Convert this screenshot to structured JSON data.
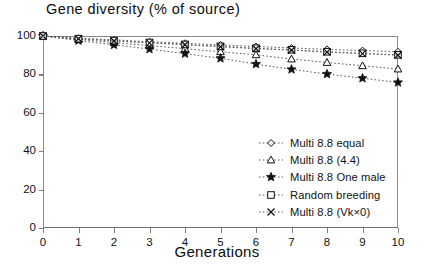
{
  "chart_data": {
    "type": "line",
    "title": "Gene diversity (% of source)",
    "xlabel": "Generations",
    "ylabel": "",
    "x": [
      0,
      1,
      2,
      3,
      4,
      5,
      6,
      7,
      8,
      9,
      10
    ],
    "xlim": [
      0,
      10
    ],
    "ylim": [
      0,
      100
    ],
    "xticks": [
      "0",
      "1",
      "2",
      "3",
      "4",
      "5",
      "6",
      "7",
      "8",
      "9",
      "10"
    ],
    "yticks": [
      "0",
      "20",
      "40",
      "60",
      "80",
      "100"
    ],
    "grid": false,
    "legend_position": "center-right",
    "series": [
      {
        "name": "Multi 8.8 equal",
        "marker": "diamond",
        "values": [
          100,
          98.8,
          98.0,
          97.0,
          96.2,
          95.4,
          94.5,
          93.8,
          93.0,
          92.4,
          91.8
        ]
      },
      {
        "name": "Multi 8.8 (4.4)",
        "marker": "triangle",
        "values": [
          100,
          98.2,
          96.6,
          95.0,
          93.4,
          91.8,
          90.2,
          88.0,
          86.2,
          84.5,
          82.8
        ]
      },
      {
        "name": "Multi 8.8 One male",
        "marker": "star",
        "values": [
          100,
          97.6,
          95.4,
          93.2,
          90.8,
          88.4,
          85.4,
          82.6,
          80.2,
          78.0,
          75.8
        ]
      },
      {
        "name": "Random breeding",
        "marker": "square",
        "values": [
          100,
          98.6,
          97.6,
          96.6,
          95.6,
          94.6,
          93.6,
          92.8,
          91.8,
          91.0,
          90.2
        ]
      },
      {
        "name": "Multi 8.8 (Vk×0)",
        "marker": "cross",
        "values": [
          100,
          98.6,
          97.4,
          96.4,
          95.4,
          94.4,
          93.4,
          92.6,
          91.6,
          90.8,
          90.0
        ]
      }
    ]
  },
  "colors": {
    "ink": "#111111",
    "axis": "#8a8a8a",
    "series_line": "#5a5a5a"
  }
}
